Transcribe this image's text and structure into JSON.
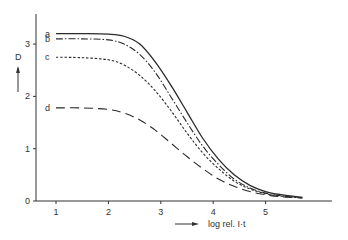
{
  "chart_data": {
    "type": "line",
    "title": "",
    "xlabel": "log rel. I·t",
    "ylabel": "D",
    "xlim": [
      0.6,
      5.9
    ],
    "ylim": [
      0,
      3.5
    ],
    "x_ticks": [
      1,
      2,
      3,
      4,
      5
    ],
    "y_ticks": [
      0,
      1,
      2,
      3
    ],
    "grid": false,
    "legend_position": "inline-left",
    "series": [
      {
        "name": "a",
        "style": "solid",
        "x": [
          1.0,
          1.5,
          2.0,
          2.3,
          2.6,
          2.9,
          3.2,
          3.5,
          3.8,
          4.1,
          4.4,
          4.7,
          5.0,
          5.3,
          5.7
        ],
        "y": [
          3.2,
          3.2,
          3.19,
          3.15,
          3.0,
          2.65,
          2.2,
          1.7,
          1.2,
          0.8,
          0.5,
          0.3,
          0.18,
          0.12,
          0.07
        ]
      },
      {
        "name": "b",
        "style": "dash-dot",
        "x": [
          1.0,
          1.5,
          2.0,
          2.3,
          2.6,
          2.9,
          3.2,
          3.5,
          3.8,
          4.1,
          4.4,
          4.7,
          5.0,
          5.3,
          5.7
        ],
        "y": [
          3.1,
          3.1,
          3.08,
          3.0,
          2.8,
          2.45,
          1.98,
          1.5,
          1.05,
          0.7,
          0.42,
          0.25,
          0.15,
          0.1,
          0.06
        ]
      },
      {
        "name": "c",
        "style": "short-dash",
        "x": [
          1.0,
          1.5,
          2.0,
          2.3,
          2.6,
          2.9,
          3.2,
          3.5,
          3.8,
          4.1,
          4.4,
          4.7,
          5.0,
          5.3,
          5.7
        ],
        "y": [
          2.75,
          2.74,
          2.7,
          2.6,
          2.4,
          2.1,
          1.72,
          1.3,
          0.92,
          0.62,
          0.38,
          0.23,
          0.14,
          0.09,
          0.06
        ]
      },
      {
        "name": "d",
        "style": "long-dash",
        "x": [
          1.0,
          1.5,
          2.0,
          2.3,
          2.6,
          2.9,
          3.2,
          3.5,
          3.8,
          4.1,
          4.4,
          4.7,
          5.0,
          5.3,
          5.7
        ],
        "y": [
          1.78,
          1.78,
          1.75,
          1.68,
          1.55,
          1.35,
          1.1,
          0.85,
          0.62,
          0.42,
          0.28,
          0.18,
          0.12,
          0.08,
          0.06
        ]
      }
    ]
  },
  "axes": {
    "ylabel": "D",
    "xlabel": "log rel. I·t",
    "x_tick_labels": [
      "1",
      "2",
      "3",
      "4",
      "5"
    ],
    "y_tick_labels": [
      "0",
      "1",
      "2",
      "3"
    ]
  },
  "labels": {
    "a": "a",
    "b": "b",
    "c": "c",
    "d": "d"
  },
  "colors": {
    "ink": "#2a2a2a",
    "background": "#ffffff"
  }
}
